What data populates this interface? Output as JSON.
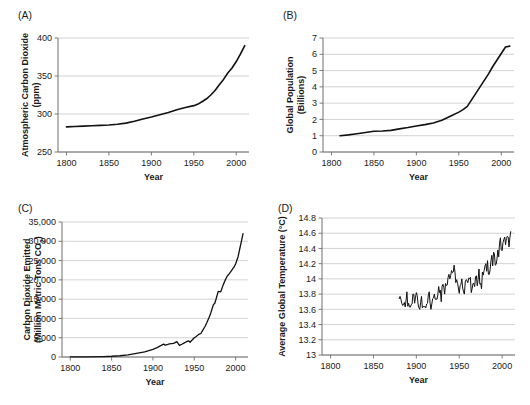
{
  "figure": {
    "background": "#ffffff",
    "line_color": "#111111",
    "grid_color": "#c8c8c8",
    "axis_color": "#6f6f6f",
    "text_color": "#1a1a1a"
  },
  "panels": [
    {
      "id": "a",
      "letter": "(A)"
    },
    {
      "id": "b",
      "letter": "(B)"
    },
    {
      "id": "c",
      "letter": "(C)"
    },
    {
      "id": "d",
      "letter": "(D)"
    }
  ],
  "chart_data": [
    {
      "panel": "A",
      "type": "line",
      "title": "",
      "xlabel": "Year",
      "ylabel": "Atmospheric Carbon Dioxide (ppm)",
      "ylabel_lines": [
        "Atmospheric Carbon Dioxide",
        "(ppm)"
      ],
      "xlim": [
        1790,
        2015
      ],
      "ylim": [
        250,
        400
      ],
      "xticks": [
        1800,
        1850,
        1900,
        1950,
        2000
      ],
      "yticks": [
        250,
        300,
        350,
        400
      ],
      "xtick_labels": [
        "1800",
        "1850",
        "1900",
        "1950",
        "2000"
      ],
      "ytick_labels": [
        "250",
        "300",
        "350",
        "400"
      ],
      "grid": true,
      "legend": "none",
      "x": [
        1800,
        1810,
        1820,
        1830,
        1840,
        1850,
        1860,
        1870,
        1880,
        1890,
        1900,
        1910,
        1920,
        1930,
        1940,
        1950,
        1955,
        1960,
        1965,
        1970,
        1975,
        1980,
        1985,
        1990,
        1995,
        2000,
        2005,
        2010
      ],
      "values": [
        283,
        283.5,
        284,
        284.5,
        285,
        285.5,
        286.5,
        288,
        290.5,
        293.5,
        296,
        299,
        302,
        305.5,
        308.5,
        311,
        313,
        316.5,
        320,
        325,
        331,
        338.5,
        345.5,
        354,
        360.5,
        369,
        379,
        390
      ]
    },
    {
      "panel": "B",
      "type": "line",
      "title": "",
      "xlabel": "Year",
      "ylabel": "Global Population (Billions)",
      "ylabel_lines": [
        "Global Population",
        "(Billions)"
      ],
      "xlim": [
        1790,
        2015
      ],
      "ylim": [
        0,
        7
      ],
      "xticks": [
        1800,
        1850,
        1900,
        1950,
        2000
      ],
      "yticks": [
        0,
        1,
        2,
        3,
        4,
        5,
        6,
        7
      ],
      "xtick_labels": [
        "1800",
        "1850",
        "1900",
        "1950",
        "2000"
      ],
      "ytick_labels": [
        "0",
        "1",
        "2",
        "3",
        "4",
        "5",
        "6",
        "7"
      ],
      "grid": true,
      "legend": "none",
      "x": [
        1810,
        1820,
        1830,
        1840,
        1850,
        1860,
        1870,
        1880,
        1890,
        1900,
        1910,
        1920,
        1930,
        1940,
        1950,
        1955,
        1960,
        1965,
        1970,
        1975,
        1980,
        1985,
        1990,
        1995,
        2000,
        2005,
        2010
      ],
      "values": [
        1.0,
        1.05,
        1.12,
        1.2,
        1.27,
        1.29,
        1.33,
        1.42,
        1.5,
        1.6,
        1.68,
        1.78,
        1.95,
        2.2,
        2.45,
        2.6,
        2.8,
        3.2,
        3.6,
        4.0,
        4.4,
        4.8,
        5.25,
        5.65,
        6.05,
        6.45,
        6.5
      ]
    },
    {
      "panel": "C",
      "type": "line",
      "title": "",
      "xlabel": "Year",
      "ylabel": "Carbon Dioxide Emitted (Million Metric Tons CO2)",
      "ylabel_lines": [
        "Carbon Dioxide Emitted",
        "(Million Metric Tons CO₂)"
      ],
      "xlim": [
        1790,
        2015
      ],
      "ylim": [
        0,
        35000
      ],
      "xticks": [
        1800,
        1850,
        1900,
        1950,
        2000
      ],
      "yticks": [
        0,
        5000,
        10000,
        15000,
        20000,
        25000,
        30000,
        35000
      ],
      "xtick_labels": [
        "1800",
        "1850",
        "1900",
        "1950",
        "2000"
      ],
      "ytick_labels": [
        "0",
        "5,000",
        "10,000",
        "15,000",
        "20,000",
        "25,000",
        "30,000",
        "35,000"
      ],
      "grid": true,
      "legend": "none",
      "x": [
        1800,
        1820,
        1840,
        1850,
        1860,
        1870,
        1880,
        1890,
        1900,
        1905,
        1910,
        1913,
        1915,
        1918,
        1920,
        1925,
        1929,
        1932,
        1935,
        1938,
        1940,
        1943,
        1945,
        1946,
        1948,
        1950,
        1952,
        1955,
        1958,
        1960,
        1963,
        1965,
        1968,
        1970,
        1973,
        1975,
        1979,
        1982,
        1985,
        1988,
        1990,
        1992,
        1995,
        1998,
        2000,
        2003,
        2005,
        2007,
        2009
      ],
      "values": [
        30,
        50,
        120,
        200,
        330,
        550,
        950,
        1350,
        2000,
        2450,
        3000,
        3350,
        3050,
        3250,
        3400,
        3550,
        4000,
        3000,
        3300,
        3650,
        3900,
        4200,
        3800,
        4100,
        4550,
        5000,
        5250,
        5800,
        6100,
        6850,
        7900,
        8800,
        10300,
        11400,
        13500,
        14000,
        17000,
        16900,
        18700,
        20200,
        21000,
        21500,
        22400,
        23300,
        24100,
        26000,
        28000,
        30000,
        32000
      ]
    },
    {
      "panel": "D",
      "type": "line",
      "title": "",
      "xlabel": "Year",
      "ylabel": "Average Global Temperature (°C)",
      "ylabel_lines": [
        "Average Global Temperature (°C)"
      ],
      "xlim": [
        1790,
        2015
      ],
      "ylim": [
        13,
        14.8
      ],
      "xticks": [
        1800,
        1850,
        1900,
        1950,
        2000
      ],
      "yticks": [
        13,
        13.2,
        13.4,
        13.6,
        13.8,
        14,
        14.2,
        14.4,
        14.6,
        14.8
      ],
      "xtick_labels": [
        "1800",
        "1850",
        "1900",
        "1950",
        "2000"
      ],
      "ytick_labels": [
        "13",
        "13.2",
        "13.4",
        "13.6",
        "13.8",
        "14",
        "14.2",
        "14.4",
        "14.6",
        "14.8"
      ],
      "grid": true,
      "legend": "none",
      "x": [
        1880,
        1881,
        1882,
        1883,
        1884,
        1885,
        1886,
        1887,
        1888,
        1889,
        1890,
        1891,
        1892,
        1893,
        1894,
        1895,
        1896,
        1897,
        1898,
        1899,
        1900,
        1901,
        1902,
        1903,
        1904,
        1905,
        1906,
        1907,
        1908,
        1909,
        1910,
        1911,
        1912,
        1913,
        1914,
        1915,
        1916,
        1917,
        1918,
        1919,
        1920,
        1921,
        1922,
        1923,
        1924,
        1925,
        1926,
        1927,
        1928,
        1929,
        1930,
        1931,
        1932,
        1933,
        1934,
        1935,
        1936,
        1937,
        1938,
        1939,
        1940,
        1941,
        1942,
        1943,
        1944,
        1945,
        1946,
        1947,
        1948,
        1949,
        1950,
        1951,
        1952,
        1953,
        1954,
        1955,
        1956,
        1957,
        1958,
        1959,
        1960,
        1961,
        1962,
        1963,
        1964,
        1965,
        1966,
        1967,
        1968,
        1969,
        1970,
        1971,
        1972,
        1973,
        1974,
        1975,
        1976,
        1977,
        1978,
        1979,
        1980,
        1981,
        1982,
        1983,
        1984,
        1985,
        1986,
        1987,
        1988,
        1989,
        1990,
        1991,
        1992,
        1993,
        1994,
        1995,
        1996,
        1997,
        1998,
        1999,
        2000,
        2001,
        2002,
        2003,
        2004,
        2005,
        2006,
        2007,
        2008,
        2009,
        2010
      ],
      "values": [
        13.74,
        13.77,
        13.73,
        13.68,
        13.65,
        13.66,
        13.69,
        13.63,
        13.72,
        13.83,
        13.64,
        13.68,
        13.63,
        13.63,
        13.66,
        13.67,
        13.8,
        13.8,
        13.68,
        13.76,
        13.82,
        13.78,
        13.67,
        13.62,
        13.6,
        13.69,
        13.77,
        13.62,
        13.64,
        13.63,
        13.64,
        13.62,
        13.67,
        13.68,
        13.79,
        13.83,
        13.68,
        13.6,
        13.67,
        13.74,
        13.75,
        13.8,
        13.73,
        13.74,
        13.73,
        13.79,
        13.9,
        13.82,
        13.85,
        13.7,
        13.9,
        13.93,
        13.89,
        13.8,
        13.94,
        13.91,
        13.92,
        14.02,
        14.06,
        14.0,
        14.04,
        14.11,
        14.08,
        14.09,
        14.18,
        14.09,
        13.95,
        13.99,
        13.95,
        13.88,
        13.81,
        13.91,
        13.93,
        14.0,
        13.88,
        13.83,
        13.8,
        13.96,
        13.99,
        13.98,
        13.95,
        14.01,
        14.0,
        14.02,
        13.82,
        13.87,
        13.94,
        13.94,
        13.9,
        14.03,
        14.04,
        13.91,
        13.99,
        14.13,
        13.93,
        13.94,
        13.87,
        14.09,
        14.05,
        14.11,
        14.17,
        14.2,
        14.1,
        14.24,
        14.06,
        14.06,
        14.12,
        14.24,
        14.31,
        14.17,
        14.35,
        14.33,
        14.18,
        14.19,
        14.26,
        14.38,
        14.29,
        14.47,
        14.54,
        14.38,
        14.37,
        14.48,
        14.52,
        14.55,
        14.45,
        14.53,
        14.56,
        14.55,
        14.42,
        14.54,
        14.62
      ]
    }
  ]
}
